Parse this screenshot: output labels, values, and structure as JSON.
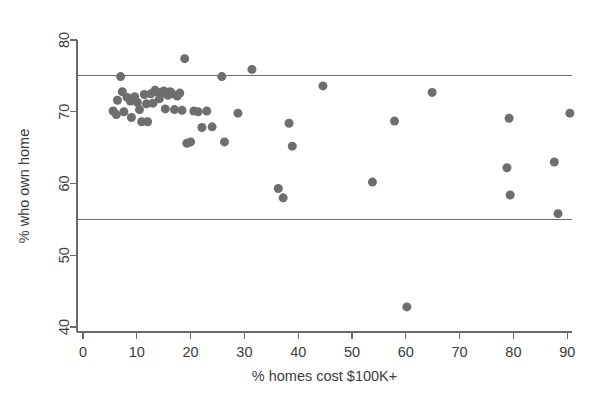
{
  "chart_data": {
    "type": "scatter",
    "title": "",
    "xlabel": "% homes cost $100K+",
    "ylabel": "% who own home",
    "xlim": [
      -2,
      94
    ],
    "ylim": [
      38.5,
      81.5
    ],
    "xticks": [
      0,
      10,
      20,
      30,
      40,
      50,
      60,
      70,
      80,
      90
    ],
    "yticks": [
      40,
      50,
      60,
      70,
      80
    ],
    "xtick_labels": [
      "0",
      "10",
      "20",
      "30",
      "40",
      "50",
      "60",
      "70",
      "80",
      "90"
    ],
    "ytick_labels": [
      "40",
      "50",
      "60",
      "70",
      "80"
    ],
    "grid": false,
    "legend": "none",
    "marker_color": "#6e6e6e",
    "marker_size": 9,
    "reference_lines": [
      {
        "orientation": "horizontal",
        "value": 75,
        "color": "#6a6a6a"
      },
      {
        "orientation": "horizontal",
        "value": 55,
        "color": "#6a6a6a"
      }
    ],
    "points": [
      {
        "x": 5.6,
        "y": 70.1
      },
      {
        "x": 6.2,
        "y": 69.6
      },
      {
        "x": 6.4,
        "y": 71.6
      },
      {
        "x": 7.0,
        "y": 74.9
      },
      {
        "x": 7.3,
        "y": 72.8
      },
      {
        "x": 7.6,
        "y": 70.0
      },
      {
        "x": 8.2,
        "y": 72.0
      },
      {
        "x": 8.8,
        "y": 71.5
      },
      {
        "x": 9.0,
        "y": 69.2
      },
      {
        "x": 9.6,
        "y": 72.1
      },
      {
        "x": 10.1,
        "y": 71.3
      },
      {
        "x": 10.5,
        "y": 70.3
      },
      {
        "x": 10.9,
        "y": 68.6
      },
      {
        "x": 11.4,
        "y": 72.4
      },
      {
        "x": 11.8,
        "y": 71.1
      },
      {
        "x": 12.0,
        "y": 68.6
      },
      {
        "x": 12.6,
        "y": 72.5
      },
      {
        "x": 13.0,
        "y": 71.2
      },
      {
        "x": 13.4,
        "y": 73.0
      },
      {
        "x": 13.9,
        "y": 72.7
      },
      {
        "x": 14.2,
        "y": 71.8
      },
      {
        "x": 14.6,
        "y": 72.6
      },
      {
        "x": 15.0,
        "y": 72.9
      },
      {
        "x": 15.3,
        "y": 70.4
      },
      {
        "x": 15.8,
        "y": 72.3
      },
      {
        "x": 16.2,
        "y": 72.8
      },
      {
        "x": 16.6,
        "y": 72.5
      },
      {
        "x": 17.0,
        "y": 70.3
      },
      {
        "x": 17.5,
        "y": 72.2
      },
      {
        "x": 18.0,
        "y": 72.6
      },
      {
        "x": 18.4,
        "y": 70.2
      },
      {
        "x": 18.9,
        "y": 77.4
      },
      {
        "x": 19.3,
        "y": 65.6
      },
      {
        "x": 20.0,
        "y": 65.8
      },
      {
        "x": 20.6,
        "y": 70.1
      },
      {
        "x": 21.4,
        "y": 70.0
      },
      {
        "x": 22.1,
        "y": 67.8
      },
      {
        "x": 23.0,
        "y": 70.1
      },
      {
        "x": 24.0,
        "y": 67.9
      },
      {
        "x": 25.8,
        "y": 74.9
      },
      {
        "x": 26.3,
        "y": 65.8
      },
      {
        "x": 28.8,
        "y": 69.8
      },
      {
        "x": 31.4,
        "y": 75.9
      },
      {
        "x": 36.3,
        "y": 59.3
      },
      {
        "x": 37.2,
        "y": 58.0
      },
      {
        "x": 38.3,
        "y": 68.4
      },
      {
        "x": 38.9,
        "y": 65.2
      },
      {
        "x": 44.6,
        "y": 73.6
      },
      {
        "x": 53.8,
        "y": 60.2
      },
      {
        "x": 57.9,
        "y": 68.7
      },
      {
        "x": 60.2,
        "y": 42.8
      },
      {
        "x": 64.9,
        "y": 72.7
      },
      {
        "x": 78.8,
        "y": 62.2
      },
      {
        "x": 79.2,
        "y": 69.1
      },
      {
        "x": 79.4,
        "y": 58.4
      },
      {
        "x": 87.6,
        "y": 63.0
      },
      {
        "x": 88.3,
        "y": 55.8
      },
      {
        "x": 90.5,
        "y": 69.8
      }
    ]
  }
}
